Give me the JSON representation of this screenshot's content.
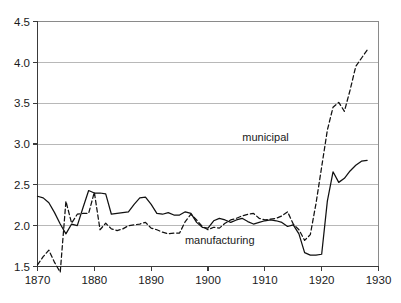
{
  "chart_data": {
    "type": "line",
    "title": "",
    "xlabel": "",
    "ylabel": "",
    "xlim": [
      1870,
      1930
    ],
    "ylim": [
      1.5,
      4.5
    ],
    "grid": true,
    "grid_axis": "y",
    "legend": "inline-annotations",
    "xticks": [
      "1870",
      "1880",
      "1890",
      "1900",
      "1910",
      "1920",
      "1930"
    ],
    "xtick_values": [
      1870,
      1880,
      1890,
      1900,
      1910,
      1920,
      1930
    ],
    "yticks": [
      "1.5",
      "2.0",
      "2.5",
      "3.0",
      "3.5",
      "4.0",
      "4.5"
    ],
    "ytick_values": [
      1.5,
      2.0,
      2.5,
      3.0,
      3.5,
      4.0,
      4.5
    ],
    "annotations": [
      {
        "text": "municipal",
        "x": 1914.2,
        "y": 3.04
      },
      {
        "text": "manufacturing",
        "x": 1908.2,
        "y": 1.78
      }
    ],
    "series": [
      {
        "name": "manufacturing",
        "style": "solid",
        "color": "#111111",
        "x": [
          1870,
          1871,
          1872,
          1873,
          1874,
          1875,
          1876,
          1877,
          1878,
          1879,
          1880,
          1881,
          1882,
          1883,
          1884,
          1885,
          1886,
          1887,
          1888,
          1889,
          1890,
          1891,
          1892,
          1893,
          1894,
          1895,
          1896,
          1897,
          1898,
          1899,
          1900,
          1901,
          1902,
          1903,
          1904,
          1905,
          1906,
          1907,
          1908,
          1909,
          1910,
          1911,
          1912,
          1913,
          1914,
          1915,
          1916,
          1917,
          1918,
          1919,
          1920,
          1921,
          1922,
          1923,
          1924,
          1925,
          1926,
          1927,
          1928
        ],
        "values": [
          2.36,
          2.34,
          2.28,
          2.16,
          2.02,
          1.9,
          2.02,
          2.0,
          2.22,
          2.43,
          2.4,
          2.4,
          2.39,
          2.14,
          2.15,
          2.16,
          2.17,
          2.26,
          2.34,
          2.35,
          2.26,
          2.15,
          2.14,
          2.16,
          2.13,
          2.13,
          2.17,
          2.15,
          2.04,
          1.98,
          1.97,
          2.06,
          2.09,
          2.07,
          2.04,
          2.07,
          2.09,
          2.05,
          2.02,
          2.04,
          2.06,
          2.07,
          2.06,
          2.04,
          1.99,
          2.01,
          1.9,
          1.67,
          1.64,
          1.64,
          1.65,
          2.3,
          2.66,
          2.53,
          2.58,
          2.67,
          2.74,
          2.79,
          2.8
        ]
      },
      {
        "name": "municipal",
        "style": "dashed",
        "color": "#111111",
        "x": [
          1870,
          1871,
          1872,
          1873,
          1874,
          1875,
          1876,
          1877,
          1878,
          1879,
          1880,
          1881,
          1882,
          1883,
          1884,
          1885,
          1886,
          1887,
          1888,
          1889,
          1890,
          1891,
          1892,
          1893,
          1894,
          1895,
          1896,
          1897,
          1898,
          1899,
          1900,
          1901,
          1902,
          1903,
          1904,
          1905,
          1906,
          1907,
          1908,
          1909,
          1910,
          1911,
          1912,
          1913,
          1914,
          1915,
          1916,
          1917,
          1918,
          1919,
          1920,
          1921,
          1922,
          1923,
          1924,
          1925,
          1926,
          1927,
          1928
        ],
        "values": [
          1.52,
          1.62,
          1.7,
          1.55,
          1.43,
          2.3,
          2.03,
          2.14,
          2.15,
          2.15,
          2.41,
          1.95,
          2.03,
          1.96,
          1.94,
          1.96,
          2.0,
          2.01,
          2.02,
          2.04,
          1.97,
          1.95,
          1.92,
          1.9,
          1.91,
          1.91,
          2.05,
          2.14,
          2.07,
          1.99,
          1.95,
          1.98,
          1.97,
          2.03,
          2.07,
          2.09,
          2.12,
          2.14,
          2.15,
          2.09,
          2.07,
          2.08,
          2.09,
          2.12,
          2.17,
          2.02,
          1.95,
          1.82,
          1.89,
          2.27,
          2.72,
          3.17,
          3.45,
          3.51,
          3.4,
          3.66,
          3.95,
          4.05,
          4.15
        ]
      }
    ]
  },
  "caption": {
    "text": ""
  }
}
